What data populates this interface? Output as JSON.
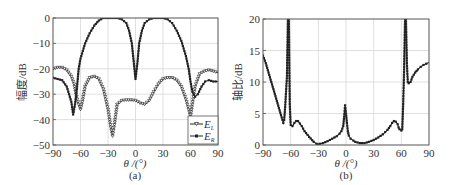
{
  "chart_data": [
    {
      "id": "a",
      "type": "line",
      "caption": "(a)",
      "title": "",
      "xlabel": "θ /(°)",
      "ylabel": "幅度/dB",
      "xlim": [
        -90,
        90
      ],
      "ylim": [
        -50,
        0
      ],
      "xticks": [
        -90,
        -60,
        -30,
        0,
        30,
        60,
        90
      ],
      "yticks": [
        0,
        -10,
        -20,
        -30,
        -40,
        -50
      ],
      "xtick_labels": [
        "−90",
        "−60",
        "−30",
        "0",
        "30",
        "60",
        "90"
      ],
      "ytick_labels": [
        "0",
        "−10",
        "−20",
        "−30",
        "−40",
        "−50"
      ],
      "grid": true,
      "legend_position": "lower right",
      "series": [
        {
          "name": "E_L",
          "legend_label": "E",
          "legend_sub": "L",
          "marker": "triangle-down-open",
          "x": [
            -90,
            -85,
            -80,
            -75,
            -70,
            -67,
            -65,
            -62,
            -60,
            -58,
            -55,
            -50,
            -45,
            -40,
            -35,
            -30,
            -27,
            -25,
            -23,
            -20,
            -15,
            -10,
            -5,
            0,
            5,
            10,
            15,
            20,
            25,
            30,
            35,
            40,
            45,
            50,
            55,
            58,
            60,
            62,
            65,
            70,
            75,
            80,
            85,
            90
          ],
          "y": [
            -20,
            -19.5,
            -19.5,
            -20.5,
            -23,
            -26,
            -30,
            -34,
            -36,
            -33,
            -27,
            -23.5,
            -23,
            -24,
            -28,
            -36,
            -43,
            -46.5,
            -42,
            -34,
            -32.5,
            -32.3,
            -32.3,
            -32.5,
            -33.5,
            -34,
            -32.5,
            -29,
            -26,
            -24,
            -23.5,
            -23.5,
            -24.5,
            -27,
            -32,
            -36,
            -39,
            -34,
            -27,
            -22,
            -21,
            -20.5,
            -21,
            -21.5
          ]
        },
        {
          "name": "E_R",
          "legend_label": "E",
          "legend_sub": "R",
          "marker": "square-filled",
          "x": [
            -90,
            -85,
            -80,
            -75,
            -70,
            -68,
            -66,
            -64,
            -62,
            -60,
            -55,
            -50,
            -45,
            -40,
            -35,
            -30,
            -25,
            -20,
            -15,
            -10,
            -7,
            -4,
            -2,
            0,
            2,
            4,
            7,
            10,
            15,
            20,
            25,
            30,
            35,
            40,
            45,
            50,
            55,
            58,
            60,
            62,
            65,
            68,
            72,
            76,
            80,
            85,
            90
          ],
          "y": [
            -23.5,
            -24,
            -24.5,
            -27,
            -33,
            -38,
            -34,
            -28,
            -20,
            -16,
            -10,
            -6,
            -3,
            -1,
            0,
            0,
            0,
            0,
            -0.5,
            -2,
            -5,
            -10,
            -17,
            -24,
            -18,
            -10,
            -5,
            -2,
            -0.5,
            0,
            0,
            0,
            -0.5,
            -2,
            -5,
            -9,
            -15,
            -20,
            -25,
            -29,
            -31,
            -30,
            -27,
            -25,
            -24.5,
            -25,
            -25
          ]
        }
      ]
    },
    {
      "id": "b",
      "type": "line",
      "caption": "(b)",
      "title": "",
      "xlabel": "θ /(°)",
      "ylabel": "轴比/dB",
      "xlim": [
        -90,
        90
      ],
      "ylim": [
        0,
        20
      ],
      "xticks": [
        -90,
        -60,
        -30,
        0,
        30,
        60,
        90
      ],
      "yticks": [
        20,
        15,
        10,
        5,
        0
      ],
      "xtick_labels": [
        "−90",
        "−60",
        "−30",
        "0",
        "30",
        "60",
        "90"
      ],
      "ytick_labels": [
        "20",
        "15",
        "10",
        "5",
        "0"
      ],
      "grid": true,
      "series": [
        {
          "name": "Axial ratio",
          "marker": "square-filled",
          "x": [
            -90,
            -87,
            -84,
            -81,
            -78,
            -75,
            -72,
            -69,
            -68,
            -67,
            -66,
            -65,
            -64,
            -63,
            -62,
            -61,
            -60,
            -58,
            -56,
            -54,
            -52,
            -50,
            -48,
            -45,
            -40,
            -35,
            -32,
            -30,
            -28,
            -25,
            -20,
            -15,
            -10,
            -7,
            -5,
            -3,
            -2,
            -1,
            0,
            1,
            2,
            3,
            5,
            8,
            10,
            15,
            20,
            25,
            30,
            35,
            40,
            45,
            48,
            50,
            52,
            54,
            56,
            57,
            58,
            60,
            61,
            62,
            63,
            64,
            65,
            66,
            67,
            68,
            70,
            72,
            75,
            78,
            81,
            84,
            87,
            90
          ],
          "y": [
            14.2,
            13,
            11.5,
            10,
            8.5,
            7,
            5.5,
            4,
            3.5,
            4,
            6,
            8.5,
            11,
            20,
            20,
            6.5,
            3.2,
            3,
            3.5,
            3.8,
            3.8,
            3.4,
            3,
            2.2,
            1.3,
            0.5,
            0.2,
            0.1,
            0.2,
            0.3,
            0.6,
            1,
            1.4,
            1.8,
            2.2,
            3,
            4.5,
            6.3,
            5,
            3.5,
            2.2,
            1.5,
            1,
            0.7,
            0.5,
            0.3,
            0.3,
            0.5,
            0.8,
            1.2,
            1.7,
            2.4,
            3,
            3.5,
            3.8,
            3.7,
            3.3,
            2.8,
            2.5,
            2.3,
            2.5,
            6.5,
            12,
            20,
            20,
            13,
            10,
            9.8,
            10,
            10.8,
            11.5,
            12,
            12.4,
            12.7,
            12.9,
            13.1
          ]
        }
      ]
    }
  ],
  "legend": {
    "items": [
      {
        "label": "E",
        "sub": "L"
      },
      {
        "label": "E",
        "sub": "R"
      }
    ]
  },
  "captions": {
    "a": "(a)",
    "b": "(b)"
  }
}
